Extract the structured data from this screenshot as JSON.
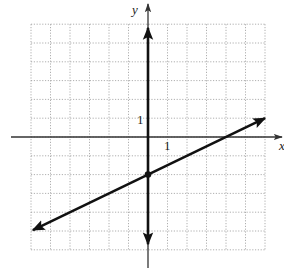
{
  "chart_data": {
    "type": "line",
    "title": "",
    "xlabel": "x",
    "ylabel": "y",
    "xlim": [
      -6,
      6
    ],
    "ylim": [
      -6,
      6
    ],
    "grid": true,
    "tick_labels": {
      "x": "1",
      "y": "1"
    },
    "series": [
      {
        "name": "line",
        "equation": "y = (1/2)x - 2",
        "slope": 0.5,
        "y_intercept": -2,
        "x_intercept": 4,
        "x": [
          -5.9,
          6
        ],
        "y": [
          -4.95,
          1
        ],
        "arrows": "both"
      },
      {
        "name": "vertical line",
        "equation": "x = 0",
        "x": [
          0,
          0
        ],
        "y": [
          5.8,
          -5.7
        ],
        "arrows": "both"
      }
    ],
    "points": [
      {
        "x": 0,
        "y": -2,
        "label": ""
      }
    ]
  },
  "colors": {
    "grid": "#9a9a9a",
    "axis": "#333333",
    "line": "#111111"
  }
}
